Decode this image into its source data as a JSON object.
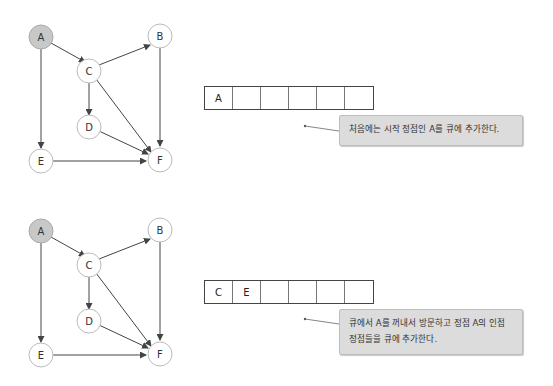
{
  "steps": [
    {
      "graph": {
        "nodes": [
          {
            "id": "A",
            "label": "A",
            "visited": true
          },
          {
            "id": "B",
            "label": "B",
            "visited": false
          },
          {
            "id": "C",
            "label": "C",
            "visited": false
          },
          {
            "id": "D",
            "label": "D",
            "visited": false
          },
          {
            "id": "E",
            "label": "E",
            "visited": false
          },
          {
            "id": "F",
            "label": "F",
            "visited": false
          }
        ],
        "edges": [
          [
            "A",
            "C"
          ],
          [
            "A",
            "E"
          ],
          [
            "C",
            "B"
          ],
          [
            "C",
            "D"
          ],
          [
            "C",
            "F"
          ],
          [
            "B",
            "F"
          ],
          [
            "D",
            "F"
          ],
          [
            "E",
            "F"
          ]
        ]
      },
      "queue": [
        "A",
        "",
        "",
        "",
        "",
        ""
      ],
      "caption": "처음에는 시작 정점인 A를 큐에 추가한다."
    },
    {
      "graph": {
        "nodes": [
          {
            "id": "A",
            "label": "A",
            "visited": true
          },
          {
            "id": "B",
            "label": "B",
            "visited": false
          },
          {
            "id": "C",
            "label": "C",
            "visited": false
          },
          {
            "id": "D",
            "label": "D",
            "visited": false
          },
          {
            "id": "E",
            "label": "E",
            "visited": false
          },
          {
            "id": "F",
            "label": "F",
            "visited": false
          }
        ],
        "edges": [
          [
            "A",
            "C"
          ],
          [
            "A",
            "E"
          ],
          [
            "C",
            "B"
          ],
          [
            "C",
            "D"
          ],
          [
            "C",
            "F"
          ],
          [
            "B",
            "F"
          ],
          [
            "D",
            "F"
          ],
          [
            "E",
            "F"
          ]
        ]
      },
      "queue": [
        "C",
        "E",
        "",
        "",
        "",
        ""
      ],
      "caption_line1": "큐에서 A를 꺼내서 방문하고 정점 A의 인접",
      "caption_line2": "정점들을 큐에 추가한다."
    }
  ],
  "colors": {
    "visited_fill": "#c8c8c8",
    "node_fill": "#ffffff",
    "node_stroke": "#bbbbbb",
    "edge": "#444444",
    "callout_bg": "#dcdcdc"
  }
}
